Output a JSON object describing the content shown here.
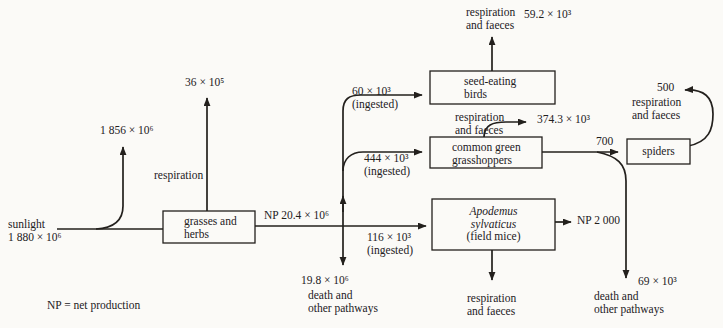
{
  "colors": {
    "ink": "#23201d",
    "paper": "#fbfaf7"
  },
  "legend": {
    "text": "NP = net production"
  },
  "nodes": {
    "grasses": {
      "line1": "grasses and",
      "line2": "herbs"
    },
    "birds": {
      "line1": "seed-eating",
      "line2": "birds"
    },
    "grasshoppers": {
      "line1": "common green",
      "line2": "grasshoppers"
    },
    "mice": {
      "line1": "Apodemus",
      "line2": "sylvaticus",
      "line3": "(field mice)"
    },
    "spiders": {
      "label": "spiders"
    }
  },
  "labels": {
    "sunlight_name": "sunlight",
    "sunlight_value": "1 880 × 10⁶",
    "not_fixed_value": "1 856 × 10⁶",
    "grasses_respiration_word": "respiration",
    "grasses_respiration_value": "36 × 10⁵",
    "grasses_np": "NP 20.4 × 10⁶",
    "grasses_death_value": "19.8 × 10⁶",
    "grasses_death_line1": "death and",
    "grasses_death_line2": "other pathways",
    "birds_ingested_value": "60 × 10³",
    "birds_ingested_word": "(ingested)",
    "birds_resp_line1": "respiration",
    "birds_resp_line2": "and faeces",
    "birds_resp_value": "59.2 × 10³",
    "grasshoppers_ingested_value": "444 × 10³",
    "grasshoppers_ingested_word": "(ingested)",
    "grasshoppers_resp_line1": "respiration",
    "grasshoppers_resp_line2": "and faeces",
    "grasshoppers_resp_value": "374.3 × 10³",
    "grasshoppers_to_spiders_value": "700",
    "grasshoppers_death_value": "69 × 10³",
    "grasshoppers_death_line1": "death and",
    "grasshoppers_death_line2": "other pathways",
    "mice_ingested_value": "116 × 10³",
    "mice_ingested_word": "(ingested)",
    "mice_np": "NP 2 000",
    "mice_resp_line1": "respiration",
    "mice_resp_line2": "and faeces",
    "spiders_resp_value": "500",
    "spiders_resp_line1": "respiration",
    "spiders_resp_line2": "and faeces"
  }
}
